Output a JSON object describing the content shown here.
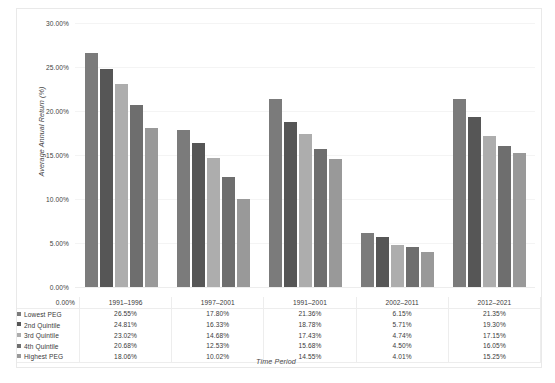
{
  "chart_data": {
    "type": "bar",
    "title": "",
    "xlabel": "Time Period",
    "ylabel": "Average Annual Return (%)",
    "ylim": [
      0,
      30
    ],
    "ytick_labels": [
      "30.00%",
      "25.00%",
      "20.00%",
      "15.00%",
      "10.00%",
      "5.00%",
      "0.00%"
    ],
    "ytick_values": [
      30,
      25,
      20,
      15,
      10,
      5,
      0
    ],
    "grid": true,
    "legend_position": "bottom-table",
    "categories": [
      "1991–1996",
      "1997–2001",
      "1991–2001",
      "2002–2011",
      "2012–2021"
    ],
    "series": [
      {
        "name": "Lowest PEG",
        "color": "#7b7b7b",
        "values": [
          26.55,
          17.8,
          21.36,
          6.15,
          21.35
        ],
        "labels": [
          "26.55%",
          "17.80%",
          "21.36%",
          "6.15%",
          "21.35%"
        ]
      },
      {
        "name": "2nd Quintile",
        "color": "#565656",
        "values": [
          24.81,
          16.33,
          18.78,
          5.71,
          19.3
        ],
        "labels": [
          "24.81%",
          "16.33%",
          "18.78%",
          "5.71%",
          "19.30%"
        ]
      },
      {
        "name": "3rd Quintile",
        "color": "#adadad",
        "values": [
          23.02,
          14.68,
          17.43,
          4.74,
          17.15
        ],
        "labels": [
          "23.02%",
          "14.68%",
          "17.43%",
          "4.74%",
          "17.15%"
        ]
      },
      {
        "name": "4th Quintile",
        "color": "#6e6e6e",
        "values": [
          20.68,
          12.53,
          15.68,
          4.5,
          16.05
        ],
        "labels": [
          "20.68%",
          "12.53%",
          "15.68%",
          "4.50%",
          "16.05%"
        ]
      },
      {
        "name": "Highest PEG",
        "color": "#999999",
        "values": [
          18.06,
          10.02,
          14.55,
          4.01,
          15.25
        ],
        "labels": [
          "18.06%",
          "10.02%",
          "14.55%",
          "4.01%",
          "15.25%"
        ]
      }
    ]
  }
}
